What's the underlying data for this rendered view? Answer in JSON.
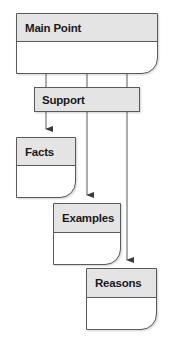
{
  "diagram": {
    "nodes": {
      "main_point": {
        "label": "Main Point"
      },
      "support": {
        "label": "Support"
      },
      "facts": {
        "label": "Facts"
      },
      "examples": {
        "label": "Examples"
      },
      "reasons": {
        "label": "Reasons"
      }
    },
    "edges": [
      {
        "from": "Main Point",
        "to": "Support"
      },
      {
        "from": "Support",
        "to": "Facts"
      },
      {
        "from": "Support",
        "to": "Examples"
      },
      {
        "from": "Support",
        "to": "Reasons"
      }
    ],
    "colors": {
      "header_fill": "#e4e4e4",
      "stroke": "#5a5a5a",
      "body_fill": "#ffffff"
    }
  }
}
